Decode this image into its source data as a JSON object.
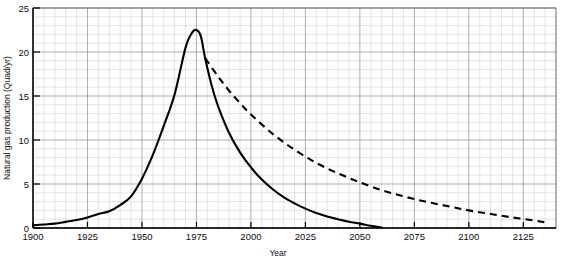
{
  "chart_data": {
    "type": "line",
    "title": "",
    "xlabel": "Year",
    "ylabel": "Natural gas production (Quad/yr)",
    "xlim": [
      1900,
      2140
    ],
    "ylim": [
      0,
      25
    ],
    "xticks": [
      1900,
      1925,
      1950,
      1975,
      2000,
      2025,
      2050,
      2075,
      2100,
      2125
    ],
    "yticks": [
      0,
      5,
      10,
      15,
      20,
      25
    ],
    "xtick_labels": [
      "1900",
      "1925",
      "1950",
      "1975",
      "2000",
      "2025",
      "2050",
      "2075",
      "2100",
      "2125"
    ],
    "ytick_labels": [
      "0",
      "5",
      "10",
      "15",
      "20",
      "25"
    ],
    "grid": true,
    "grid_minor_spacing_x": 5,
    "grid_minor_spacing_y": 1,
    "grid_major_spacing_x": 25,
    "grid_major_spacing_y": 5,
    "legend": null,
    "legend_position": "none",
    "annotations": [],
    "series": [
      {
        "name": "Natural gas production (lower ultimate resource)",
        "style": "solid",
        "color": "#000000",
        "x": [
          1900,
          1905,
          1910,
          1915,
          1920,
          1925,
          1930,
          1935,
          1940,
          1945,
          1950,
          1955,
          1960,
          1965,
          1970,
          1973,
          1975,
          1977,
          1979,
          1982,
          1985,
          1990,
          1995,
          2000,
          2005,
          2010,
          2015,
          2020,
          2025,
          2030,
          2035,
          2040,
          2045,
          2050,
          2055,
          2060
        ],
        "y": [
          0.3,
          0.4,
          0.5,
          0.7,
          0.9,
          1.2,
          1.6,
          1.9,
          2.6,
          3.6,
          5.6,
          8.3,
          11.6,
          15.2,
          20.5,
          22.2,
          22.5,
          21.8,
          19.3,
          16.2,
          13.8,
          10.8,
          8.6,
          6.9,
          5.5,
          4.4,
          3.5,
          2.8,
          2.2,
          1.7,
          1.3,
          1.0,
          0.7,
          0.5,
          0.25,
          0.05
        ]
      },
      {
        "name": "Natural gas production (higher ultimate resource)",
        "style": "dashed",
        "color": "#000000",
        "x": [
          1979,
          1985,
          1990,
          1995,
          2000,
          2010,
          2020,
          2030,
          2040,
          2050,
          2060,
          2070,
          2080,
          2090,
          2100,
          2110,
          2120,
          2130,
          2136
        ],
        "y": [
          19.3,
          17.2,
          15.6,
          14.2,
          12.9,
          10.7,
          8.9,
          7.4,
          6.2,
          5.2,
          4.3,
          3.6,
          3.0,
          2.5,
          2.0,
          1.6,
          1.2,
          0.85,
          0.6
        ]
      }
    ]
  },
  "axes": {
    "x_title": "Year",
    "y_title": "Natural gas production (Quad/yr)"
  }
}
